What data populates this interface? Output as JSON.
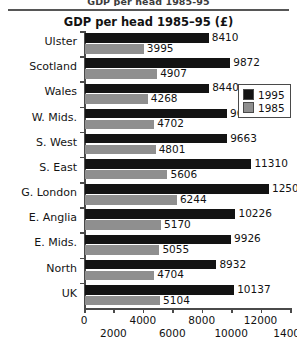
{
  "page": {
    "top_caption": "GDP per head 1985-95"
  },
  "legend": {
    "entries": [
      {
        "label": "1995",
        "color": "#131313"
      },
      {
        "label": "1985",
        "color": "#8f8f8f"
      }
    ]
  },
  "chart_data": {
    "type": "bar",
    "orientation": "horizontal",
    "title": "GDP per head 1985–95 (£)",
    "xlabel": "",
    "ylabel": "",
    "xlim": [
      0,
      14000
    ],
    "grid": false,
    "legend_position": "right",
    "xticks": [
      0,
      2000,
      4000,
      6000,
      8000,
      10000,
      12000,
      14000
    ],
    "xtick_labels": [
      "0",
      "2000",
      "4000",
      "6000",
      "8000",
      "10000",
      "12000",
      "14000"
    ],
    "categories": [
      "Ulster",
      "Scotland",
      "Wales",
      "W. Mids.",
      "S. West",
      "S. East",
      "G. London",
      "E. Anglia",
      "E. Mids.",
      "North",
      "UK"
    ],
    "series": [
      {
        "name": "1995",
        "color": "#131313",
        "values": [
          8410,
          9872,
          8440,
          9649,
          9663,
          11310,
          12503,
          10226,
          9926,
          8932,
          10137
        ],
        "labels": [
          "8410",
          "9872",
          "8440",
          "9649",
          "9663",
          "11310",
          "12503",
          "10226",
          "9926",
          "8932",
          "10137"
        ]
      },
      {
        "name": "1985",
        "color": "#8f8f8f",
        "values": [
          3995,
          4907,
          4268,
          4702,
          4801,
          5606,
          6244,
          5170,
          5055,
          4704,
          5104
        ],
        "labels": [
          "3995",
          "4907",
          "4268",
          "4702",
          "4801",
          "5606",
          "6244",
          "5170",
          "5055",
          "4704",
          "5104"
        ]
      }
    ]
  }
}
